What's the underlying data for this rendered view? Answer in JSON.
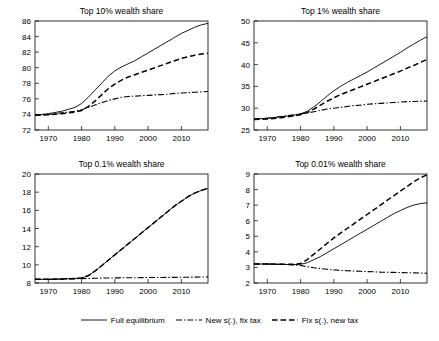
{
  "figure": {
    "legend": {
      "items": [
        {
          "label": "Full equilibrium",
          "style": "solid",
          "name": "legend-item-full-equilibrium"
        },
        {
          "label": "New s(.), fix tax",
          "style": "dash-dot",
          "name": "legend-item-new-s-fix-tax"
        },
        {
          "label": "Fix s(.), new tax",
          "style": "dashed",
          "name": "legend-item-fix-s-new-tax"
        }
      ]
    }
  },
  "chart_data": [
    {
      "type": "line",
      "panel": "top-left",
      "title": "Top 10% wealth share",
      "xlabel": "",
      "ylabel": "",
      "xlim": [
        1966,
        2018
      ],
      "ylim": [
        72,
        86
      ],
      "xticks": [
        1970,
        1980,
        1990,
        2000,
        2010
      ],
      "yticks": [
        72,
        74,
        76,
        78,
        80,
        82,
        84,
        86
      ],
      "grid": false,
      "legend_position": "below-figure",
      "x": [
        1966,
        1970,
        1974,
        1978,
        1980,
        1982,
        1984,
        1986,
        1988,
        1990,
        1992,
        1994,
        1996,
        1998,
        2000,
        2002,
        2004,
        2006,
        2008,
        2010,
        2012,
        2014,
        2016,
        2018
      ],
      "series": [
        {
          "name": "Full equilibrium",
          "style": "solid",
          "values": [
            73.9,
            74.1,
            74.4,
            74.9,
            75.4,
            76.2,
            77.1,
            78.0,
            78.9,
            79.6,
            80.1,
            80.5,
            80.9,
            81.4,
            81.9,
            82.4,
            82.9,
            83.4,
            83.9,
            84.4,
            84.8,
            85.2,
            85.5,
            85.7
          ]
        },
        {
          "name": "New s(.), fix tax",
          "style": "dash-dot",
          "values": [
            73.9,
            74.0,
            74.2,
            74.4,
            74.6,
            74.9,
            75.2,
            75.5,
            75.8,
            76.0,
            76.2,
            76.3,
            76.35,
            76.4,
            76.45,
            76.5,
            76.55,
            76.6,
            76.7,
            76.75,
            76.8,
            76.85,
            76.9,
            76.95
          ]
        },
        {
          "name": "Fix s(.), new tax",
          "style": "dashed",
          "values": [
            73.9,
            73.95,
            74.1,
            74.3,
            74.5,
            75.0,
            75.7,
            76.5,
            77.3,
            77.9,
            78.4,
            78.8,
            79.1,
            79.4,
            79.7,
            80.0,
            80.3,
            80.6,
            80.9,
            81.2,
            81.4,
            81.6,
            81.75,
            81.85
          ]
        }
      ]
    },
    {
      "type": "line",
      "panel": "top-right",
      "title": "Top 1% wealth share",
      "xlabel": "",
      "ylabel": "",
      "xlim": [
        1966,
        2018
      ],
      "ylim": [
        25,
        50
      ],
      "xticks": [
        1970,
        1980,
        1990,
        2000,
        2010
      ],
      "yticks": [
        25,
        30,
        35,
        40,
        45,
        50
      ],
      "grid": false,
      "legend_position": "below-figure",
      "x": [
        1966,
        1970,
        1974,
        1978,
        1980,
        1982,
        1984,
        1986,
        1988,
        1990,
        1992,
        1994,
        1996,
        1998,
        2000,
        2002,
        2004,
        2006,
        2008,
        2010,
        2012,
        2014,
        2016,
        2018
      ],
      "series": [
        {
          "name": "Full equilibrium",
          "style": "solid",
          "values": [
            27.5,
            27.7,
            28.0,
            28.4,
            28.7,
            29.3,
            30.3,
            31.5,
            32.8,
            34.0,
            35.0,
            35.9,
            36.7,
            37.5,
            38.3,
            39.2,
            40.1,
            41.0,
            41.9,
            42.8,
            43.8,
            44.7,
            45.6,
            46.4
          ]
        },
        {
          "name": "New s(.), fix tax",
          "style": "dash-dot",
          "values": [
            27.5,
            27.7,
            28.1,
            28.5,
            28.7,
            28.9,
            29.2,
            29.5,
            29.8,
            30.0,
            30.2,
            30.4,
            30.6,
            30.7,
            30.9,
            31.0,
            31.1,
            31.2,
            31.3,
            31.4,
            31.5,
            31.55,
            31.6,
            31.65
          ]
        },
        {
          "name": "Fix s(.), new tax",
          "style": "dashed",
          "values": [
            27.4,
            27.5,
            27.8,
            28.2,
            28.5,
            29.0,
            29.8,
            30.7,
            31.6,
            32.4,
            33.1,
            33.7,
            34.3,
            34.9,
            35.5,
            36.1,
            36.7,
            37.3,
            37.9,
            38.5,
            39.2,
            39.8,
            40.5,
            41.2
          ]
        }
      ]
    },
    {
      "type": "line",
      "panel": "bottom-left",
      "title": "Top 0.1% wealth share",
      "xlabel": "",
      "ylabel": "",
      "xlim": [
        1966,
        2018
      ],
      "ylim": [
        8,
        20
      ],
      "xticks": [
        1970,
        1980,
        1990,
        2000,
        2010
      ],
      "yticks": [
        8,
        10,
        12,
        14,
        16,
        18,
        20
      ],
      "grid": false,
      "legend_position": "below-figure",
      "x": [
        1966,
        1970,
        1974,
        1978,
        1980,
        1982,
        1984,
        1986,
        1988,
        1990,
        1992,
        1994,
        1996,
        1998,
        2000,
        2002,
        2004,
        2006,
        2008,
        2010,
        2012,
        2014,
        2016,
        2018
      ],
      "series": [
        {
          "name": "Full equilibrium",
          "style": "solid",
          "values": [
            8.4,
            8.4,
            8.45,
            8.5,
            8.55,
            8.8,
            9.3,
            9.9,
            10.5,
            11.1,
            11.7,
            12.3,
            12.9,
            13.5,
            14.1,
            14.7,
            15.3,
            15.9,
            16.5,
            17.0,
            17.5,
            17.9,
            18.2,
            18.4
          ]
        },
        {
          "name": "New s(.), fix tax",
          "style": "dash-dot",
          "values": [
            8.4,
            8.4,
            8.42,
            8.45,
            8.48,
            8.5,
            8.52,
            8.54,
            8.55,
            8.56,
            8.57,
            8.58,
            8.58,
            8.59,
            8.6,
            8.6,
            8.61,
            8.62,
            8.62,
            8.63,
            8.64,
            8.65,
            8.66,
            8.67
          ]
        },
        {
          "name": "Fix s(.), new tax",
          "style": "dashed",
          "values": [
            8.4,
            8.4,
            8.45,
            8.5,
            8.55,
            8.8,
            9.3,
            9.9,
            10.5,
            11.1,
            11.7,
            12.3,
            12.9,
            13.5,
            14.1,
            14.7,
            15.3,
            15.9,
            16.5,
            17.0,
            17.5,
            17.9,
            18.2,
            18.45
          ]
        }
      ]
    },
    {
      "type": "line",
      "panel": "bottom-right",
      "title": "Top 0.01% wealth share",
      "xlabel": "",
      "ylabel": "",
      "xlim": [
        1966,
        2018
      ],
      "ylim": [
        2,
        9
      ],
      "xticks": [
        1970,
        1980,
        1990,
        2000,
        2010
      ],
      "yticks": [
        2,
        3,
        4,
        5,
        6,
        7,
        8,
        9
      ],
      "grid": false,
      "legend_position": "below-figure",
      "x": [
        1966,
        1970,
        1974,
        1978,
        1980,
        1982,
        1984,
        1986,
        1988,
        1990,
        1992,
        1994,
        1996,
        1998,
        2000,
        2002,
        2004,
        2006,
        2008,
        2010,
        2012,
        2014,
        2016,
        2018
      ],
      "series": [
        {
          "name": "Full equilibrium",
          "style": "solid",
          "values": [
            3.22,
            3.22,
            3.2,
            3.18,
            3.2,
            3.3,
            3.5,
            3.7,
            3.95,
            4.2,
            4.45,
            4.7,
            4.95,
            5.2,
            5.45,
            5.7,
            5.95,
            6.2,
            6.45,
            6.65,
            6.85,
            7.0,
            7.1,
            7.15
          ]
        },
        {
          "name": "New s(.), fix tax",
          "style": "dash-dot",
          "values": [
            3.22,
            3.22,
            3.2,
            3.16,
            3.12,
            3.05,
            2.98,
            2.92,
            2.88,
            2.84,
            2.81,
            2.79,
            2.77,
            2.75,
            2.73,
            2.72,
            2.7,
            2.69,
            2.68,
            2.67,
            2.66,
            2.65,
            2.64,
            2.63
          ]
        },
        {
          "name": "Fix s(.), new tax",
          "style": "dashed",
          "values": [
            3.22,
            3.22,
            3.2,
            3.2,
            3.25,
            3.5,
            3.85,
            4.2,
            4.55,
            4.9,
            5.2,
            5.5,
            5.8,
            6.1,
            6.4,
            6.7,
            7.0,
            7.3,
            7.6,
            7.9,
            8.2,
            8.5,
            8.75,
            8.95
          ]
        }
      ]
    }
  ]
}
